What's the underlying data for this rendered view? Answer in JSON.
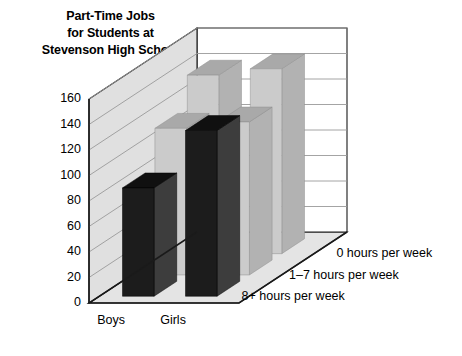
{
  "chart_data": {
    "type": "bar",
    "render": "3d-grouped-bar",
    "title": "Part-Time Jobs for Students at Stevenson High School",
    "title_lines": [
      "Part-Time Jobs",
      "for Students at",
      "Stevenson High School"
    ],
    "xlabel": "",
    "ylabel": "",
    "zlabel": "",
    "categories": [
      "Boys",
      "Girls"
    ],
    "depth_categories": [
      "0 hours per week",
      "1–7 hours per week",
      "8+ hours per week"
    ],
    "legend_position": "depth-axis-right",
    "grid": true,
    "ylim": [
      0,
      160
    ],
    "ytick_step": 20,
    "yticks": [
      "160",
      "140",
      "120",
      "100",
      "80",
      "60",
      "40",
      "20",
      "0"
    ],
    "ytick_values": [
      160,
      140,
      120,
      100,
      80,
      60,
      40,
      20,
      0
    ],
    "series": [
      {
        "name": "0 hours per week",
        "values": [
          140,
          145
        ],
        "color": "#cbcbcb"
      },
      {
        "name": "1–7 hours per week",
        "values": [
          115,
          120
        ],
        "color": "#c9c9c9"
      },
      {
        "name": "8+ hours per week",
        "values": [
          85,
          130
        ],
        "color": "#1c1c1c"
      }
    ],
    "points": [
      {
        "category": "Boys",
        "group": "0 hours per week",
        "value": 140
      },
      {
        "category": "Boys",
        "group": "1–7 hours per week",
        "value": 115
      },
      {
        "category": "Boys",
        "group": "8+ hours per week",
        "value": 85
      },
      {
        "category": "Girls",
        "group": "0 hours per week",
        "value": 145
      },
      {
        "category": "Girls",
        "group": "1–7 hours per week",
        "value": 120
      },
      {
        "category": "Girls",
        "group": "8+ hours per week",
        "value": 130
      }
    ]
  },
  "colors": {
    "background": "#ffffff",
    "floor": "#e4e4e4",
    "wall": "#ffffff",
    "wall_left": "#e0e0e0",
    "grid": "#9a9a9a",
    "axis": "#1a1a1a",
    "bar_light_front": "#cbcbcb",
    "bar_light_side": "#b2b2b2",
    "bar_light_top": "#a9a9a9",
    "bar_dark_front": "#1c1c1c",
    "bar_dark_side": "#3d3d3d",
    "bar_dark_top": "#101010",
    "text": "#000000"
  }
}
